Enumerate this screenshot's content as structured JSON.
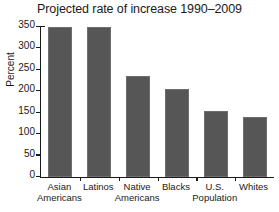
{
  "chart_data": {
    "type": "bar",
    "title": "Projected rate of increase 1990–2009",
    "xlabel": "",
    "ylabel": "Percent",
    "categories": [
      "Asian Americans",
      "Latinos",
      "Native Americans",
      "Blacks",
      "U.S. Population",
      "Whites"
    ],
    "category_lines": [
      {
        "line1": "Asian",
        "line2": "Americans"
      },
      {
        "line1": "Latinos",
        "line2": ""
      },
      {
        "line1": "Native",
        "line2": "Americans"
      },
      {
        "line1": "Blacks",
        "line2": ""
      },
      {
        "line1": "U.S.",
        "line2": "Population"
      },
      {
        "line1": "Whites",
        "line2": ""
      }
    ],
    "values": [
      350,
      350,
      235,
      205,
      155,
      140
    ],
    "ylim": [
      0,
      350
    ],
    "yticks": [
      0,
      50,
      100,
      150,
      200,
      250,
      300,
      350
    ],
    "ytick_labels": [
      "0",
      "50",
      "100",
      "150",
      "200",
      "250",
      "300",
      "350"
    ],
    "grid": false,
    "legend": false,
    "bar_color": "#565656",
    "axis_color": "#1a1a1a",
    "background": "#ffffff"
  }
}
